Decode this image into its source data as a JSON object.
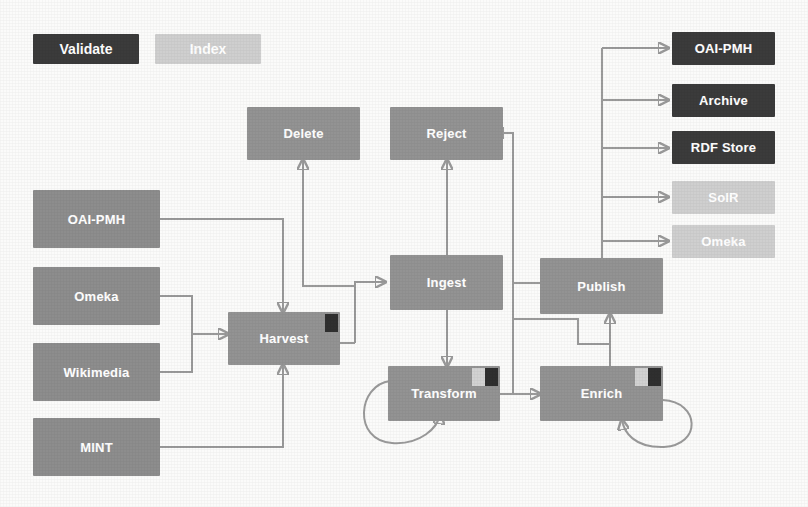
{
  "diagram": {
    "colors": {
      "validate": "#3b3b3b",
      "index": "#cfcfcf",
      "process": "#8d8d8d",
      "wire": "#9a9a9a",
      "background": "#fbfbfa"
    },
    "legend": [
      {
        "label": "Validate",
        "style": "dark"
      },
      {
        "label": "Index",
        "style": "light"
      }
    ],
    "sources": [
      {
        "label": "OAI-PMH"
      },
      {
        "label": "Omeka"
      },
      {
        "label": "Wikimedia"
      },
      {
        "label": "MINT"
      }
    ],
    "process": [
      {
        "label": "Harvest",
        "badges": [
          "validate"
        ]
      },
      {
        "label": "Delete",
        "badges": []
      },
      {
        "label": "Reject",
        "badges": []
      },
      {
        "label": "Ingest",
        "badges": []
      },
      {
        "label": "Transform",
        "badges": [
          "index",
          "validate"
        ]
      },
      {
        "label": "Enrich",
        "badges": [
          "index",
          "validate"
        ]
      },
      {
        "label": "Publish",
        "badges": []
      }
    ],
    "outputs": [
      {
        "label": "OAI-PMH",
        "style": "dark"
      },
      {
        "label": "Archive",
        "style": "dark"
      },
      {
        "label": "RDF Store",
        "style": "dark"
      },
      {
        "label": "SolR",
        "style": "light"
      },
      {
        "label": "Omeka",
        "style": "light"
      }
    ]
  }
}
